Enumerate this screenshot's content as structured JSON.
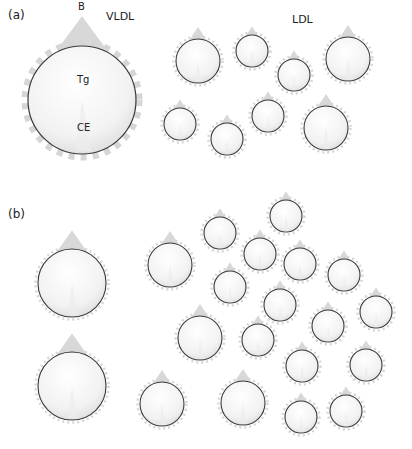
{
  "panels": [
    {
      "id": "a",
      "label": "(a)",
      "label_pos": [
        8,
        8
      ],
      "titles": [
        {
          "text": "VLDL",
          "x": 106,
          "y": 10
        },
        {
          "text": "LDL",
          "x": 292,
          "y": 13
        }
      ],
      "particle_labels": [
        {
          "text": "B",
          "x": 78,
          "y": 1
        },
        {
          "text": "Tg",
          "x": 77,
          "y": 74
        },
        {
          "text": "CE",
          "x": 77,
          "y": 122
        }
      ],
      "particles": [
        {
          "type": "VLDL",
          "cx": 82,
          "cy": 100,
          "r": 54
        },
        {
          "type": "LDL",
          "cx": 198,
          "cy": 61,
          "r": 22
        },
        {
          "type": "LDL",
          "cx": 252,
          "cy": 51,
          "r": 16
        },
        {
          "type": "LDL",
          "cx": 294,
          "cy": 75,
          "r": 16
        },
        {
          "type": "LDL",
          "cx": 348,
          "cy": 59,
          "r": 22
        },
        {
          "type": "LDL",
          "cx": 180,
          "cy": 124,
          "r": 16
        },
        {
          "type": "LDL",
          "cx": 227,
          "cy": 139,
          "r": 16
        },
        {
          "type": "LDL",
          "cx": 268,
          "cy": 116,
          "r": 16
        },
        {
          "type": "LDL",
          "cx": 326,
          "cy": 128,
          "r": 22
        }
      ]
    },
    {
      "id": "b",
      "label": "(b)",
      "label_pos": [
        8,
        207
      ],
      "titles": [],
      "particle_labels": [],
      "particles": [
        {
          "type": "large",
          "cx": 72,
          "cy": 283,
          "r": 34
        },
        {
          "type": "large",
          "cx": 72,
          "cy": 386,
          "r": 34
        },
        {
          "type": "medium",
          "cx": 170,
          "cy": 265,
          "r": 22
        },
        {
          "type": "small",
          "cx": 220,
          "cy": 233,
          "r": 16
        },
        {
          "type": "small",
          "cx": 286,
          "cy": 216,
          "r": 16
        },
        {
          "type": "small",
          "cx": 260,
          "cy": 254,
          "r": 16
        },
        {
          "type": "small",
          "cx": 300,
          "cy": 264,
          "r": 16
        },
        {
          "type": "small",
          "cx": 344,
          "cy": 275,
          "r": 16
        },
        {
          "type": "small",
          "cx": 230,
          "cy": 287,
          "r": 16
        },
        {
          "type": "small",
          "cx": 280,
          "cy": 305,
          "r": 16
        },
        {
          "type": "small",
          "cx": 376,
          "cy": 312,
          "r": 16
        },
        {
          "type": "medium",
          "cx": 200,
          "cy": 338,
          "r": 22
        },
        {
          "type": "small",
          "cx": 258,
          "cy": 340,
          "r": 16
        },
        {
          "type": "small",
          "cx": 328,
          "cy": 326,
          "r": 16
        },
        {
          "type": "small",
          "cx": 302,
          "cy": 366,
          "r": 16
        },
        {
          "type": "small",
          "cx": 366,
          "cy": 365,
          "r": 16
        },
        {
          "type": "medium",
          "cx": 162,
          "cy": 404,
          "r": 22
        },
        {
          "type": "medium",
          "cx": 243,
          "cy": 403,
          "r": 22
        },
        {
          "type": "small",
          "cx": 301,
          "cy": 417,
          "r": 16
        },
        {
          "type": "small",
          "cx": 346,
          "cy": 411,
          "r": 16
        }
      ]
    }
  ],
  "colors": {
    "background": "#ffffff",
    "outline": "#3a3a3a",
    "fill_light": "#ffffff",
    "fill_dark": "#e4e4e4",
    "apo_b": "#d8d8d8",
    "text": "#222222"
  }
}
